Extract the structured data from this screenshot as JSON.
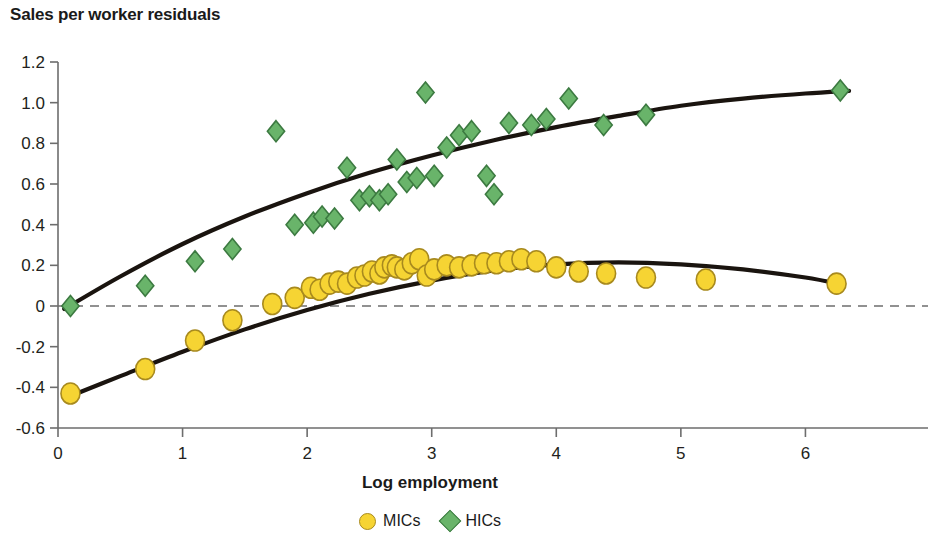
{
  "chart_data": {
    "type": "scatter",
    "title": "Sales per worker residuals",
    "xlabel": "Log employment",
    "ylabel": "",
    "xlim": [
      0,
      7
    ],
    "ylim": [
      -0.6,
      1.2
    ],
    "xticks": [
      "0",
      "1",
      "2",
      "3",
      "4",
      "5",
      "6",
      "7"
    ],
    "xtick_values": [
      0,
      1,
      2,
      3,
      4,
      5,
      6,
      7
    ],
    "yticks": [
      "1.2",
      "1.0",
      "0.8",
      "0.6",
      "0.4",
      "0.2",
      "0",
      "-0.2",
      "-0.4",
      "-0.6"
    ],
    "ytick_values": [
      1.2,
      1.0,
      0.8,
      0.6,
      0.4,
      0.2,
      0,
      -0.2,
      -0.4,
      -0.6
    ],
    "grid": false,
    "legend_position": "bottom-center",
    "zero_reference_line": 0,
    "series": [
      {
        "name": "MICs",
        "marker": "circle",
        "color": "#f6d433",
        "edge_color": "#a88a1e",
        "points": [
          [
            0.1,
            -0.43
          ],
          [
            0.7,
            -0.31
          ],
          [
            1.1,
            -0.17
          ],
          [
            1.4,
            -0.07
          ],
          [
            1.72,
            0.01
          ],
          [
            1.9,
            0.04
          ],
          [
            2.03,
            0.09
          ],
          [
            2.1,
            0.08
          ],
          [
            2.18,
            0.11
          ],
          [
            2.25,
            0.12
          ],
          [
            2.32,
            0.11
          ],
          [
            2.4,
            0.14
          ],
          [
            2.46,
            0.15
          ],
          [
            2.52,
            0.17
          ],
          [
            2.58,
            0.16
          ],
          [
            2.62,
            0.19
          ],
          [
            2.68,
            0.2
          ],
          [
            2.72,
            0.19
          ],
          [
            2.78,
            0.18
          ],
          [
            2.84,
            0.21
          ],
          [
            2.9,
            0.23
          ],
          [
            2.96,
            0.15
          ],
          [
            3.02,
            0.18
          ],
          [
            3.12,
            0.2
          ],
          [
            3.22,
            0.19
          ],
          [
            3.32,
            0.2
          ],
          [
            3.42,
            0.21
          ],
          [
            3.52,
            0.21
          ],
          [
            3.62,
            0.22
          ],
          [
            3.72,
            0.23
          ],
          [
            3.84,
            0.22
          ],
          [
            4.0,
            0.19
          ],
          [
            4.18,
            0.17
          ],
          [
            4.4,
            0.16
          ],
          [
            4.72,
            0.14
          ],
          [
            5.2,
            0.13
          ],
          [
            6.25,
            0.11
          ]
        ],
        "fit_curve": [
          [
            0.05,
            -0.455
          ],
          [
            0.5,
            -0.345
          ],
          [
            1.0,
            -0.225
          ],
          [
            1.5,
            -0.115
          ],
          [
            2.0,
            -0.02
          ],
          [
            2.5,
            0.06
          ],
          [
            3.0,
            0.125
          ],
          [
            3.5,
            0.175
          ],
          [
            4.0,
            0.205
          ],
          [
            4.5,
            0.215
          ],
          [
            5.0,
            0.205
          ],
          [
            5.5,
            0.18
          ],
          [
            6.0,
            0.14
          ],
          [
            6.3,
            0.105
          ]
        ]
      },
      {
        "name": "HICs",
        "marker": "diamond",
        "color": "#69b46a",
        "edge_color": "#3c7a41",
        "points": [
          [
            0.1,
            0.0
          ],
          [
            0.7,
            0.1
          ],
          [
            1.1,
            0.22
          ],
          [
            1.4,
            0.28
          ],
          [
            1.75,
            0.86
          ],
          [
            1.9,
            0.4
          ],
          [
            2.05,
            0.41
          ],
          [
            2.12,
            0.44
          ],
          [
            2.22,
            0.43
          ],
          [
            2.32,
            0.68
          ],
          [
            2.42,
            0.52
          ],
          [
            2.5,
            0.54
          ],
          [
            2.58,
            0.52
          ],
          [
            2.65,
            0.55
          ],
          [
            2.72,
            0.72
          ],
          [
            2.8,
            0.61
          ],
          [
            2.88,
            0.63
          ],
          [
            2.95,
            1.05
          ],
          [
            3.02,
            0.64
          ],
          [
            3.12,
            0.78
          ],
          [
            3.22,
            0.84
          ],
          [
            3.32,
            0.86
          ],
          [
            3.44,
            0.64
          ],
          [
            3.5,
            0.55
          ],
          [
            3.62,
            0.9
          ],
          [
            3.8,
            0.89
          ],
          [
            3.92,
            0.92
          ],
          [
            4.1,
            1.02
          ],
          [
            4.38,
            0.89
          ],
          [
            4.72,
            0.94
          ],
          [
            6.28,
            1.06
          ]
        ],
        "fit_curve": [
          [
            0.05,
            -0.015
          ],
          [
            0.5,
            0.145
          ],
          [
            1.0,
            0.305
          ],
          [
            1.5,
            0.44
          ],
          [
            2.0,
            0.555
          ],
          [
            2.5,
            0.655
          ],
          [
            3.0,
            0.74
          ],
          [
            3.5,
            0.815
          ],
          [
            4.0,
            0.88
          ],
          [
            4.5,
            0.935
          ],
          [
            5.0,
            0.985
          ],
          [
            5.5,
            1.02
          ],
          [
            6.0,
            1.045
          ],
          [
            6.35,
            1.058
          ]
        ]
      }
    ]
  },
  "legend": {
    "items": [
      {
        "label": "MICs",
        "marker": "circle"
      },
      {
        "label": "HICs",
        "marker": "diamond"
      }
    ]
  }
}
